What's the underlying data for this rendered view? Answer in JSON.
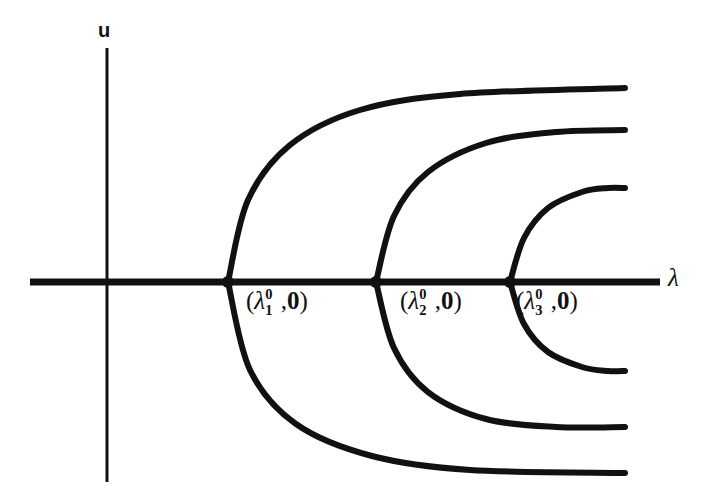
{
  "figure": {
    "type": "bifurcation-diagram",
    "background_color": "#ffffff",
    "stroke_color": "#111111"
  },
  "axes": {
    "vertical": {
      "name": "u-axis",
      "label": "u",
      "x": 107,
      "y_top": 48,
      "y_bottom": 482,
      "stroke_width": 3
    },
    "horizontal": {
      "name": "lambda-axis",
      "label": "λ",
      "y": 282,
      "x_left": 30,
      "x_right": 660,
      "stroke_width": 7
    }
  },
  "bifurcation_points": [
    {
      "id": "point-1",
      "label_open": "(",
      "label_lambda": "λ",
      "label_superscript": "0",
      "label_subscript": "1",
      "label_comma": ",",
      "label_zero": "0",
      "label_close": ")",
      "label_text": "(λ₁⁰,0)",
      "x": 228,
      "y": 282
    },
    {
      "id": "point-2",
      "label_open": "(",
      "label_lambda": "λ",
      "label_superscript": "0",
      "label_subscript": "2",
      "label_comma": ",",
      "label_zero": "0",
      "label_close": ")",
      "label_text": "(λ₂⁰,0)",
      "x": 376,
      "y": 282
    },
    {
      "id": "point-3",
      "label_open": "(",
      "label_lambda": "λ",
      "label_superscript": "0",
      "label_subscript": "3",
      "label_comma": ",",
      "label_zero": "0",
      "label_close": ")",
      "label_text": "(λ₃⁰,0)",
      "x": 510,
      "y": 282
    }
  ],
  "chart_data": {
    "type": "line",
    "title": "",
    "xlabel": "λ",
    "ylabel": "u",
    "grid": false,
    "legend": "none",
    "xlim": [
      30,
      660
    ],
    "ylim": [
      482,
      48
    ],
    "series": [
      {
        "name": "trivial-branch",
        "points": [
          [
            30,
            282
          ],
          [
            660,
            282
          ]
        ]
      },
      {
        "name": "branch-1-upper",
        "points": [
          [
            228,
            282
          ],
          [
            248,
            200
          ],
          [
            290,
            145
          ],
          [
            360,
            110
          ],
          [
            460,
            94
          ],
          [
            625,
            88
          ]
        ]
      },
      {
        "name": "branch-1-lower",
        "points": [
          [
            228,
            282
          ],
          [
            250,
            370
          ],
          [
            296,
            424
          ],
          [
            372,
            456
          ],
          [
            470,
            470
          ],
          [
            625,
            473
          ]
        ]
      },
      {
        "name": "branch-2-upper",
        "points": [
          [
            376,
            282
          ],
          [
            394,
            216
          ],
          [
            428,
            172
          ],
          [
            486,
            143
          ],
          [
            556,
            132
          ],
          [
            625,
            130
          ]
        ]
      },
      {
        "name": "branch-2-lower",
        "points": [
          [
            376,
            282
          ],
          [
            394,
            348
          ],
          [
            428,
            392
          ],
          [
            486,
            419
          ],
          [
            556,
            427
          ],
          [
            625,
            427
          ]
        ]
      },
      {
        "name": "branch-3-upper",
        "points": [
          [
            510,
            282
          ],
          [
            524,
            238
          ],
          [
            548,
            208
          ],
          [
            582,
            192
          ],
          [
            608,
            188
          ],
          [
            625,
            188
          ]
        ]
      },
      {
        "name": "branch-3-lower",
        "points": [
          [
            510,
            282
          ],
          [
            524,
            324
          ],
          [
            548,
            352
          ],
          [
            582,
            367
          ],
          [
            608,
            371
          ],
          [
            625,
            371
          ]
        ]
      }
    ]
  }
}
